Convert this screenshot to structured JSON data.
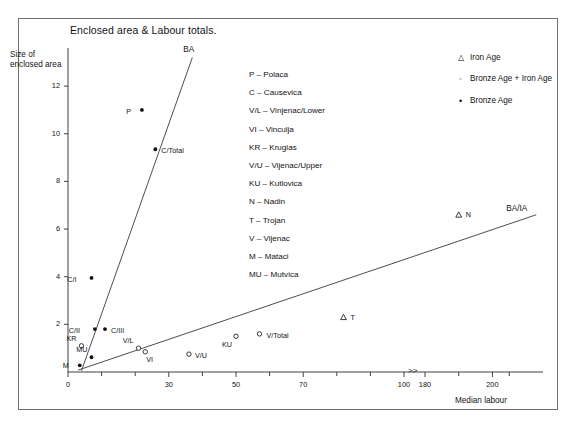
{
  "chart_title": "Enclosed area & Labour totals.",
  "axes": {
    "ylabel": "Size of enclosed area",
    "xlabel": "Median labour",
    "y_ticks": [
      "2",
      "4",
      "6",
      "8",
      "10",
      "12"
    ],
    "x_ticks": [
      "0",
      "30",
      "50",
      "70",
      "100",
      "180",
      "200"
    ],
    "axis_break_symbol": ">>"
  },
  "marker_legend": [
    {
      "glyph": "△",
      "label": "Iron Age",
      "kind": "tri"
    },
    {
      "glyph": "◦",
      "label": "Bronze Age + Iron Age",
      "kind": "circ"
    },
    {
      "glyph": "•",
      "label": "Bronze Age",
      "kind": "dot"
    }
  ],
  "abbreviations": [
    "P – Polaca",
    "C – Causevica",
    "V/L – Vinjenac/Lower",
    "VI – Vinculja",
    "KR – Kruglas",
    "V/U – Vijenac/Upper",
    "KU – Kutlovica",
    "N – Nadin",
    "T – Trojan",
    "V – Vijenac",
    "M – Mataci",
    "MU – Mutvica"
  ],
  "trend_lines": [
    {
      "name": "BA",
      "label": "BA"
    },
    {
      "name": "BA/IA",
      "label": "BA/IA"
    }
  ],
  "chart_data": {
    "type": "scatter",
    "title": "Enclosed area & Labour totals.",
    "xlabel": "Median labour",
    "ylabel": "Size of enclosed area",
    "xlim": [
      0,
      215
    ],
    "ylim": [
      0,
      13.6
    ],
    "grid": false,
    "legend_position": "top-right",
    "axis_break": {
      "after": 100,
      "before": 180,
      "symbol": ">>"
    },
    "series": [
      {
        "name": "Bronze Age",
        "marker": "filled-dot",
        "points": [
          {
            "label": "P",
            "x": 22,
            "y": 11.0
          },
          {
            "label": "C/Total",
            "x": 26,
            "y": 9.35
          },
          {
            "label": "C/I",
            "x": 7,
            "y": 3.95
          },
          {
            "label": "C/II",
            "x": 8,
            "y": 1.8
          },
          {
            "label": "C/III",
            "x": 11,
            "y": 1.8
          },
          {
            "label": "MU",
            "x": 7,
            "y": 0.62
          },
          {
            "label": "M",
            "x": 3.5,
            "y": 0.28
          }
        ]
      },
      {
        "name": "Bronze Age + Iron Age",
        "marker": "open-circle",
        "points": [
          {
            "label": "KR",
            "x": 4,
            "y": 1.1
          },
          {
            "label": "V/L",
            "x": 21,
            "y": 1.0
          },
          {
            "label": "VI",
            "x": 23,
            "y": 0.85
          },
          {
            "label": "V/U",
            "x": 36,
            "y": 0.75
          },
          {
            "label": "KU",
            "x": 50,
            "y": 1.5
          },
          {
            "label": "V/Total",
            "x": 57,
            "y": 1.6
          }
        ]
      },
      {
        "name": "Iron Age",
        "marker": "open-triangle",
        "points": [
          {
            "label": "T",
            "x": 82,
            "y": 2.3
          },
          {
            "label": "N",
            "x": 190,
            "y": 6.6
          }
        ]
      }
    ],
    "trend_lines": [
      {
        "name": "BA",
        "label": "BA",
        "x0": 4,
        "y0": 0.05,
        "x1": 37,
        "y1": 13.2
      },
      {
        "name": "BA/IA",
        "label": "BA/IA",
        "x0": 3,
        "y0": 0.08,
        "x1": 213,
        "y1": 6.6
      }
    ]
  }
}
